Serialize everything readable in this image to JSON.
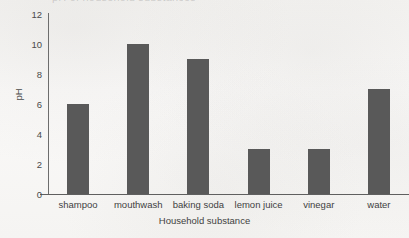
{
  "chart_data": {
    "type": "bar",
    "title": "",
    "xlabel": "Household substance",
    "ylabel": "pH",
    "categories": [
      "shampoo",
      "mouthwash",
      "baking soda",
      "lemon juice",
      "vinegar",
      "water"
    ],
    "values": [
      6,
      10,
      9,
      3,
      3,
      7
    ],
    "ylim": [
      0,
      12
    ],
    "yticks": [
      0,
      2,
      4,
      6,
      8,
      10,
      12
    ],
    "ytick_labels": [
      "0",
      "2",
      "4",
      "6",
      "8",
      "10",
      "12"
    ],
    "grid": false,
    "legend": false,
    "bar_color": "#595959",
    "axis_color": "#5f5f5f",
    "background_color": "#f7f6f4"
  },
  "page": {
    "clipped_title_fragment": "pH of household substances"
  }
}
